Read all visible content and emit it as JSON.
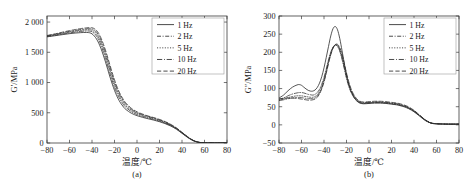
{
  "figure": {
    "background": "#ffffff",
    "line_color": "#2b2b2b",
    "axis_color": "#3a3a3a",
    "panels": [
      "a",
      "b"
    ]
  },
  "panel_a": {
    "caption": "(a)",
    "ylabel": "G′/MPa",
    "xlabel": "温度/℃",
    "xticks": [
      "-80",
      "-60",
      "-40",
      "-20",
      "0",
      "20",
      "40",
      "60",
      "80"
    ],
    "yticks": [
      "0",
      "500",
      "1 000",
      "1 500",
      "2 000"
    ],
    "legend": [
      {
        "label": "1 Hz",
        "dash": "none"
      },
      {
        "label": "2 Hz",
        "dash": "dashdot"
      },
      {
        "label": "5 Hz",
        "dash": "dotted"
      },
      {
        "label": "10 Hz",
        "dash": "dashdotlong"
      },
      {
        "label": "20 Hz",
        "dash": "dashed"
      }
    ]
  },
  "panel_b": {
    "caption": "(b)",
    "ylabel": "G″/MPa",
    "xlabel": "温度/℃",
    "xticks": [
      "-80",
      "-60",
      "-40",
      "-20",
      "0",
      "20",
      "40",
      "60",
      "80"
    ],
    "yticks": [
      "-50",
      "0",
      "50",
      "100",
      "150",
      "200",
      "250",
      "300"
    ],
    "legend": [
      {
        "label": "1 Hz",
        "dash": "none"
      },
      {
        "label": "2 Hz",
        "dash": "dashdot"
      },
      {
        "label": "5 Hz",
        "dash": "dotted"
      },
      {
        "label": "10 Hz",
        "dash": "dashdotlong"
      },
      {
        "label": "20 Hz",
        "dash": "dashed"
      }
    ]
  },
  "chart_data": [
    {
      "id": "panel-a",
      "type": "line",
      "title": "",
      "caption": "(a)",
      "xlabel": "温度/℃",
      "ylabel": "G′/MPa",
      "xlim": [
        -80,
        80
      ],
      "ylim": [
        0,
        2100
      ],
      "xticks": [
        -80,
        -60,
        -40,
        -20,
        0,
        20,
        40,
        60,
        80
      ],
      "yticks": [
        0,
        500,
        1000,
        1500,
        2000
      ],
      "ytick_labels": [
        "0",
        "500",
        "1 000",
        "1 500",
        "2 000"
      ],
      "grid": false,
      "legend_position": "top-right",
      "x": [
        -80,
        -75,
        -70,
        -65,
        -60,
        -55,
        -50,
        -45,
        -42,
        -40,
        -38,
        -36,
        -34,
        -32,
        -30,
        -28,
        -26,
        -24,
        -22,
        -20,
        -18,
        -16,
        -14,
        -12,
        -10,
        -5,
        0,
        5,
        10,
        15,
        20,
        25,
        30,
        35,
        40,
        45,
        50,
        55,
        60,
        70,
        80
      ],
      "series": [
        {
          "name": "1 Hz",
          "dash": "none",
          "values": [
            1755,
            1768,
            1782,
            1795,
            1808,
            1818,
            1825,
            1828,
            1822,
            1805,
            1770,
            1720,
            1650,
            1560,
            1455,
            1340,
            1215,
            1090,
            975,
            870,
            780,
            705,
            645,
            595,
            556,
            492,
            452,
            424,
            400,
            378,
            352,
            320,
            280,
            228,
            160,
            92,
            38,
            10,
            4,
            2,
            2
          ]
        },
        {
          "name": "2 Hz",
          "dash": "dashdot",
          "values": [
            1760,
            1775,
            1790,
            1806,
            1820,
            1834,
            1845,
            1852,
            1850,
            1840,
            1812,
            1768,
            1702,
            1615,
            1512,
            1398,
            1272,
            1148,
            1030,
            922,
            830,
            752,
            688,
            634,
            590,
            518,
            472,
            440,
            414,
            390,
            362,
            330,
            288,
            234,
            166,
            96,
            40,
            11,
            4,
            2,
            2
          ]
        },
        {
          "name": "5 Hz",
          "dash": "dotted",
          "values": [
            1768,
            1784,
            1800,
            1818,
            1834,
            1850,
            1862,
            1872,
            1872,
            1864,
            1842,
            1802,
            1742,
            1660,
            1560,
            1448,
            1325,
            1200,
            1080,
            968,
            872,
            790,
            722,
            665,
            618,
            540,
            490,
            456,
            428,
            402,
            374,
            340,
            296,
            240,
            170,
            99,
            42,
            12,
            4,
            2,
            2
          ]
        },
        {
          "name": "10 Hz",
          "dash": "dashdotlong",
          "values": [
            1772,
            1790,
            1808,
            1828,
            1846,
            1862,
            1876,
            1888,
            1890,
            1885,
            1868,
            1834,
            1778,
            1700,
            1604,
            1494,
            1372,
            1246,
            1124,
            1010,
            910,
            824,
            752,
            692,
            642,
            558,
            504,
            468,
            438,
            412,
            382,
            348,
            302,
            245,
            174,
            102,
            43,
            12,
            4,
            2,
            2
          ]
        },
        {
          "name": "20 Hz",
          "dash": "dashed",
          "values": [
            1778,
            1796,
            1816,
            1838,
            1858,
            1876,
            1892,
            1904,
            1908,
            1905,
            1892,
            1862,
            1810,
            1736,
            1642,
            1534,
            1412,
            1286,
            1162,
            1046,
            942,
            852,
            778,
            716,
            664,
            574,
            516,
            478,
            446,
            420,
            390,
            354,
            308,
            250,
            178,
            104,
            44,
            13,
            4,
            2,
            2
          ]
        }
      ]
    },
    {
      "id": "panel-b",
      "type": "line",
      "title": "",
      "caption": "(b)",
      "xlabel": "温度/℃",
      "ylabel": "G″/MPa",
      "xlim": [
        -80,
        80
      ],
      "ylim": [
        -50,
        300
      ],
      "xticks": [
        -80,
        -60,
        -40,
        -20,
        0,
        20,
        40,
        60,
        80
      ],
      "yticks": [
        -50,
        0,
        50,
        100,
        150,
        200,
        250,
        300
      ],
      "ytick_labels": [
        "-50",
        "0",
        "50",
        "100",
        "150",
        "200",
        "250",
        "300"
      ],
      "grid": false,
      "legend_position": "top-right",
      "x": [
        -80,
        -76,
        -72,
        -68,
        -64,
        -62,
        -60,
        -58,
        -56,
        -54,
        -52,
        -50,
        -48,
        -46,
        -44,
        -42,
        -40,
        -38,
        -36,
        -34,
        -32,
        -30,
        -28,
        -26,
        -24,
        -22,
        -20,
        -18,
        -16,
        -14,
        -12,
        -10,
        -8,
        -5,
        0,
        5,
        10,
        15,
        20,
        25,
        30,
        35,
        40,
        45,
        50,
        55,
        60,
        70,
        80
      ],
      "series": [
        {
          "name": "1 Hz",
          "dash": "none",
          "values": [
            74,
            82,
            94,
            104,
            110,
            111,
            109,
            104,
            99,
            95,
            93,
            93,
            96,
            103,
            115,
            133,
            157,
            186,
            216,
            245,
            265,
            271,
            262,
            238,
            205,
            170,
            138,
            112,
            93,
            80,
            70,
            63,
            60,
            58,
            59,
            60,
            60,
            59,
            57,
            55,
            51,
            45,
            36,
            24,
            12,
            5,
            3,
            2,
            2
          ]
        },
        {
          "name": "2 Hz",
          "dash": "dashdot",
          "values": [
            70,
            74,
            80,
            85,
            88,
            89,
            89,
            88,
            86,
            84,
            83,
            82,
            84,
            89,
            98,
            112,
            131,
            154,
            179,
            200,
            214,
            220,
            216,
            203,
            181,
            155,
            128,
            106,
            90,
            78,
            70,
            64,
            61,
            59,
            60,
            61,
            61,
            60,
            58,
            56,
            52,
            46,
            37,
            25,
            13,
            5,
            3,
            2,
            2
          ]
        },
        {
          "name": "5 Hz",
          "dash": "dotted",
          "values": [
            68,
            71,
            75,
            78,
            80,
            80,
            80,
            79,
            78,
            77,
            76,
            76,
            78,
            83,
            92,
            106,
            125,
            149,
            175,
            197,
            213,
            220,
            218,
            206,
            185,
            159,
            132,
            110,
            93,
            81,
            72,
            66,
            62,
            60,
            61,
            62,
            62,
            61,
            59,
            57,
            53,
            47,
            38,
            26,
            13,
            5,
            3,
            2,
            2
          ]
        },
        {
          "name": "10 Hz",
          "dash": "dashdotlong",
          "values": [
            67,
            69,
            72,
            74,
            75,
            75,
            75,
            74,
            73,
            72,
            72,
            72,
            74,
            79,
            88,
            102,
            121,
            145,
            172,
            195,
            212,
            221,
            220,
            210,
            190,
            164,
            137,
            114,
            96,
            83,
            74,
            67,
            63,
            61,
            62,
            63,
            63,
            62,
            60,
            58,
            54,
            48,
            39,
            26,
            14,
            5,
            3,
            2,
            2
          ]
        },
        {
          "name": "20 Hz",
          "dash": "dashed",
          "values": [
            72,
            73,
            74,
            74,
            73,
            72,
            71,
            70,
            69,
            68,
            68,
            69,
            71,
            76,
            85,
            99,
            118,
            142,
            169,
            193,
            211,
            221,
            222,
            213,
            195,
            170,
            143,
            119,
            100,
            86,
            76,
            69,
            65,
            63,
            64,
            65,
            65,
            64,
            62,
            60,
            56,
            50,
            40,
            27,
            14,
            6,
            3,
            2,
            2
          ]
        }
      ]
    }
  ]
}
